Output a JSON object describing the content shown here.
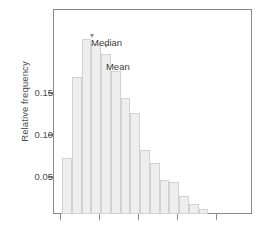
{
  "chart_data": {
    "type": "bar",
    "title": "",
    "subtitle": "",
    "xlabel": "",
    "ylabel": "Relative frequency",
    "ylim": [
      0,
      0.1665
    ],
    "xlim": [
      0,
      1
    ],
    "grid": false,
    "legend": null,
    "y_ticks": [
      0.05,
      0.1,
      0.15
    ],
    "y_tick_labels": [
      "0.05",
      "0.10",
      "0.15"
    ],
    "x_ticks": [
      0.035,
      0.231,
      0.427,
      0.623,
      0.819
    ],
    "x_tick_labels": [
      "",
      "",
      "",
      "",
      ""
    ],
    "categories": [
      "1",
      "2",
      "3",
      "4",
      "5",
      "6",
      "7",
      "8",
      "9",
      "10",
      "11",
      "12",
      "13",
      "14",
      "15"
    ],
    "values": [
      0.045,
      0.111,
      0.142,
      0.138,
      0.13,
      0.116,
      0.094,
      0.082,
      0.052,
      0.041,
      0.027,
      0.026,
      0.014,
      0.008,
      0.004
    ],
    "bar_color": "#eeeeee",
    "bar_edge_color": "#d2d2d2",
    "axis_color": "#8a8a8a",
    "text_color": "#4d4d4d",
    "annotations": [
      {
        "text": "Median",
        "target_value": 0.138,
        "label_x": 0.186,
        "arrow_x": 0.191
      },
      {
        "text": "Mean",
        "target_value": 0.13,
        "label_x": 0.261,
        "arrow_x": 0.262
      }
    ]
  },
  "axes": {
    "y_title": "Relative frequency",
    "ticks": {
      "y": [
        "0.15",
        "0.10",
        "0.05"
      ]
    }
  },
  "annotations": {
    "median": {
      "label": "Median"
    },
    "mean": {
      "label": "Mean"
    }
  }
}
